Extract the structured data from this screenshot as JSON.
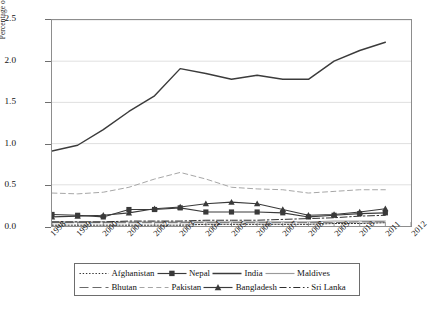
{
  "chart_data": {
    "type": "line",
    "title": "",
    "xlabel": "",
    "ylabel": "Percentage of arrivals",
    "xlim": [
      1998,
      2012
    ],
    "ylim": [
      0.0,
      2.5
    ],
    "grid": true,
    "legend_position": "bottom",
    "x": [
      1998,
      1999,
      2000,
      2001,
      2002,
      2003,
      2004,
      2005,
      2006,
      2007,
      2008,
      2009,
      2010,
      2011
    ],
    "x_tick_labels": [
      "1998",
      "1999",
      "2000",
      "2001",
      "2002",
      "2003",
      "2004",
      "2005",
      "2006",
      "2007",
      "2008",
      "2009",
      "2010",
      "2011",
      "2012"
    ],
    "y_tick_labels": [
      "0.0",
      "0.5",
      "1.0",
      "1.5",
      "2.0",
      "2.5"
    ],
    "y_ticks": [
      0.0,
      0.5,
      1.0,
      1.5,
      2.0,
      2.5
    ],
    "series": [
      {
        "name": "Afghanistan",
        "style": "dotted",
        "marker": "none",
        "color": "#333333",
        "values": [
          0.01,
          0.01,
          0.01,
          0.01,
          0.01,
          0.01,
          0.02,
          0.02,
          0.02,
          0.02,
          0.02,
          0.03,
          0.03,
          0.04
        ]
      },
      {
        "name": "Nepal",
        "style": "solid",
        "marker": "square",
        "color": "#3a3a3a",
        "values": [
          0.14,
          0.13,
          0.11,
          0.2,
          0.2,
          0.22,
          0.17,
          0.17,
          0.17,
          0.16,
          0.11,
          0.13,
          0.15,
          0.16
        ]
      },
      {
        "name": "India",
        "style": "solid",
        "marker": "none",
        "color": "#3b3b3b",
        "values": [
          0.91,
          0.98,
          1.17,
          1.39,
          1.58,
          1.91,
          1.85,
          1.78,
          1.83,
          1.78,
          1.78,
          2.0,
          2.13,
          2.23
        ]
      },
      {
        "name": "Maldives",
        "style": "solid",
        "marker": "none",
        "color": "#9a9a9a",
        "values": [
          0.05,
          0.05,
          0.05,
          0.05,
          0.05,
          0.05,
          0.05,
          0.05,
          0.05,
          0.05,
          0.05,
          0.06,
          0.06,
          0.06
        ]
      },
      {
        "name": "Bhutan",
        "style": "longdash",
        "marker": "none",
        "color": "#6a6a6a",
        "values": [
          0.04,
          0.04,
          0.04,
          0.04,
          0.04,
          0.04,
          0.04,
          0.04,
          0.04,
          0.04,
          0.04,
          0.04,
          0.05,
          0.05
        ]
      },
      {
        "name": "Pakistan",
        "style": "dashed",
        "marker": "none",
        "color": "#a5a5a5",
        "values": [
          0.4,
          0.39,
          0.41,
          0.47,
          0.57,
          0.65,
          0.57,
          0.47,
          0.45,
          0.44,
          0.4,
          0.42,
          0.44,
          0.44
        ]
      },
      {
        "name": "Bangladesh",
        "style": "solid",
        "marker": "triangle",
        "color": "#3a3a3a",
        "values": [
          0.11,
          0.12,
          0.13,
          0.16,
          0.21,
          0.23,
          0.27,
          0.29,
          0.27,
          0.2,
          0.13,
          0.14,
          0.17,
          0.21
        ]
      },
      {
        "name": "Sri Lanka",
        "style": "dashdot",
        "marker": "none",
        "color": "#2e2e2e",
        "values": [
          0.05,
          0.05,
          0.05,
          0.06,
          0.06,
          0.06,
          0.07,
          0.07,
          0.07,
          0.08,
          0.09,
          0.1,
          0.12,
          0.13
        ]
      }
    ]
  },
  "axis": {
    "y_title": "Percentage of arrivals"
  },
  "legend": {
    "row1": [
      "Afghanistan",
      "Nepal",
      "India",
      "Maldives"
    ],
    "row2": [
      "Bhutan",
      "Pakistan",
      "Bangladesh",
      "Sri Lanka"
    ]
  },
  "caption": {
    "text": ""
  }
}
